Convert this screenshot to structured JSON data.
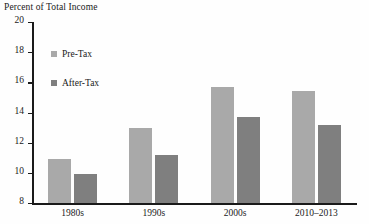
{
  "chart_data": {
    "type": "bar",
    "title": "Percent of Total Income",
    "xlabel": "",
    "ylabel": "Percent of Total Income",
    "categories": [
      "1980s",
      "1990s",
      "2000s",
      "2010–2013"
    ],
    "series": [
      {
        "name": "Pre-Tax",
        "color": "#a9a9a9",
        "values": [
          10.9,
          13.0,
          15.7,
          15.4
        ]
      },
      {
        "name": "After-Tax",
        "color": "#7f7f7f",
        "values": [
          9.9,
          11.2,
          13.7,
          13.2
        ]
      }
    ],
    "ylim": [
      8,
      20
    ],
    "yticks": [
      8,
      10,
      12,
      14,
      16,
      18,
      20
    ],
    "ytick_labels": [
      "8",
      "10",
      "12",
      "14",
      "16",
      "18",
      "20"
    ],
    "grid": false,
    "legend_position": "upper-left-inside"
  },
  "legend": {
    "items": [
      {
        "label": "Pre-Tax",
        "color": "#a9a9a9"
      },
      {
        "label": "After-Tax",
        "color": "#7f7f7f"
      }
    ]
  },
  "colors": {
    "background": "#fefefe",
    "axis": "#1a1a1a",
    "text": "#1a1a1a",
    "pre_tax": "#a9a9a9",
    "after_tax": "#7f7f7f"
  }
}
